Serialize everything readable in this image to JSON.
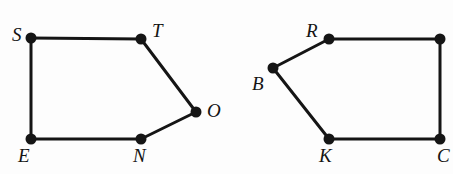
{
  "figure": {
    "kind": "geometry-diagram",
    "background_color": "#fdfdfd",
    "stroke_color": "#151515",
    "edge_width": 3,
    "vertex_dot_color": "#151515",
    "vertex_dot_radius": 5.5,
    "label_color": "#141414",
    "polygons": [
      {
        "id": "pentagon-stone",
        "name": "STONE",
        "vertices": [
          {
            "id": "S",
            "label": "S",
            "x": 31,
            "y": 38,
            "label_x": 12,
            "label_y": 25
          },
          {
            "id": "T",
            "label": "T",
            "x": 141,
            "y": 39,
            "label_x": 152,
            "label_y": 21
          },
          {
            "id": "O",
            "label": "O",
            "x": 196,
            "y": 112,
            "label_x": 207,
            "label_y": 101
          },
          {
            "id": "N",
            "label": "N",
            "x": 141,
            "y": 139,
            "label_x": 133,
            "label_y": 146
          },
          {
            "id": "E",
            "label": "E",
            "x": 31,
            "y": 139,
            "label_x": 18,
            "label_y": 146
          }
        ],
        "edges": [
          {
            "from": "S",
            "to": "T"
          },
          {
            "from": "T",
            "to": "O"
          },
          {
            "from": "O",
            "to": "N"
          },
          {
            "from": "N",
            "to": "E"
          },
          {
            "from": "E",
            "to": "S"
          }
        ]
      },
      {
        "id": "pentagon-brkce",
        "name": "BRKC",
        "vertices": [
          {
            "id": "R",
            "label": "R",
            "x": 329,
            "y": 39,
            "label_x": 306,
            "label_y": 21
          },
          {
            "id": "E2",
            "label": "",
            "x": 440,
            "y": 39,
            "label_x": 450,
            "label_y": 21
          },
          {
            "id": "C",
            "label": "C",
            "x": 440,
            "y": 139,
            "label_x": 437,
            "label_y": 146
          },
          {
            "id": "K",
            "label": "K",
            "x": 329,
            "y": 139,
            "label_x": 319,
            "label_y": 146
          },
          {
            "id": "B",
            "label": "B",
            "x": 273,
            "y": 68,
            "label_x": 252,
            "label_y": 74
          }
        ],
        "edges": [
          {
            "from": "R",
            "to": "E2"
          },
          {
            "from": "E2",
            "to": "C"
          },
          {
            "from": "C",
            "to": "K"
          },
          {
            "from": "K",
            "to": "B"
          },
          {
            "from": "B",
            "to": "R"
          }
        ]
      }
    ]
  }
}
